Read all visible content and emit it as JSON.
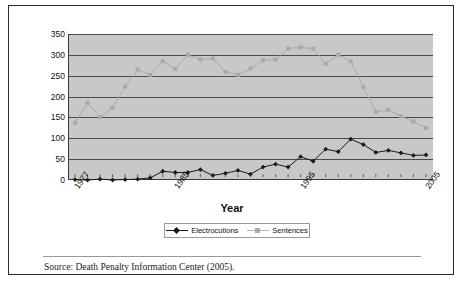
{
  "figure": {
    "axis_title": "Year",
    "source_note": "Source: Death Penalty Information Center (2005).",
    "colors": {
      "plot_background": "#c8c8c8",
      "gridline": "#4a4a4a",
      "electrocutions": "#1a1a1a",
      "sentences": "#a9a9a9",
      "frame": "#2b2b2b"
    }
  },
  "legend": {
    "position": "bottom-center",
    "entries": [
      {
        "label": "Electrocutions",
        "marker": "diamond-marker-icon",
        "color": "#1a1a1a"
      },
      {
        "label": "Sentences",
        "marker": "square-marker-icon",
        "color": "#a9a9a9"
      }
    ]
  },
  "chart_data": {
    "type": "line",
    "title": "",
    "subtitle": "",
    "xlabel": "Year",
    "ylabel": "",
    "xlim": [
      1977,
      2005
    ],
    "ylim": [
      0,
      350
    ],
    "ytick_labels": [
      "350",
      "300",
      "250",
      "200",
      "150",
      "100",
      "50",
      "0"
    ],
    "yticks": [
      350,
      300,
      250,
      200,
      150,
      100,
      50,
      0
    ],
    "xtick_labels": [
      "1977",
      "1985",
      "1995",
      "2005"
    ],
    "xticks": [
      1977,
      1985,
      1995,
      2005
    ],
    "grid": true,
    "legend_position": "bottom-center",
    "x": [
      1977,
      1978,
      1979,
      1980,
      1981,
      1982,
      1983,
      1984,
      1985,
      1986,
      1987,
      1988,
      1989,
      1990,
      1991,
      1992,
      1993,
      1994,
      1995,
      1996,
      1997,
      1998,
      1999,
      2000,
      2001,
      2002,
      2003,
      2004,
      2005
    ],
    "series": [
      {
        "name": "Electrocutions",
        "marker": "diamond",
        "color": "#1a1a1a",
        "values": [
          1,
          0,
          2,
          0,
          1,
          2,
          5,
          21,
          18,
          18,
          25,
          11,
          16,
          23,
          14,
          31,
          38,
          31,
          56,
          45,
          74,
          68,
          98,
          85,
          66,
          71,
          65,
          59,
          60
        ]
      },
      {
        "name": "Sentences",
        "marker": "square",
        "color": "#a9a9a9",
        "values": [
          137,
          185,
          151,
          173,
          224,
          265,
          252,
          285,
          266,
          300,
          289,
          291,
          259,
          252,
          267,
          287,
          289,
          315,
          318,
          315,
          279,
          300,
          284,
          223,
          163,
          168,
          153,
          140,
          125
        ]
      }
    ]
  }
}
